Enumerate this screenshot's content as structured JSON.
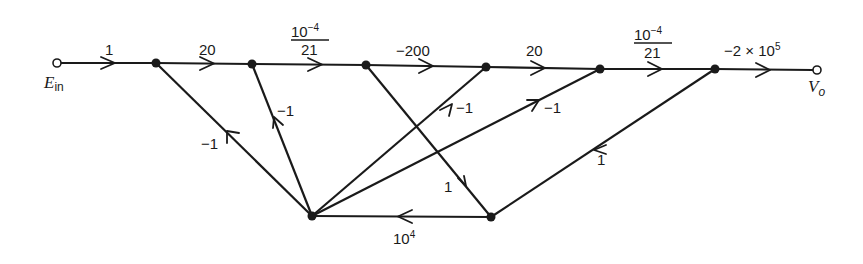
{
  "diagram": {
    "type": "signal-flow-graph",
    "input": {
      "label": "E",
      "subscript": "in"
    },
    "output": {
      "label": "V",
      "subscript": "o"
    },
    "nodes": [
      {
        "id": "Ein",
        "x": 57,
        "y": 63,
        "kind": "source"
      },
      {
        "id": "N1",
        "x": 156,
        "y": 63
      },
      {
        "id": "N2",
        "x": 252,
        "y": 64
      },
      {
        "id": "N3",
        "x": 366,
        "y": 65
      },
      {
        "id": "N4",
        "x": 486,
        "y": 67
      },
      {
        "id": "N5",
        "x": 600,
        "y": 69
      },
      {
        "id": "N6",
        "x": 715,
        "y": 69
      },
      {
        "id": "Vo",
        "x": 817,
        "y": 70,
        "kind": "sink"
      },
      {
        "id": "B1",
        "x": 312,
        "y": 216
      },
      {
        "id": "B2",
        "x": 491,
        "y": 217
      }
    ],
    "edges": [
      {
        "from": "Ein",
        "to": "N1",
        "gain": "1"
      },
      {
        "from": "N1",
        "to": "N2",
        "gain": "20"
      },
      {
        "from": "N2",
        "to": "N3",
        "gain_num": "10",
        "gain_exp": "−4",
        "gain_den": "21"
      },
      {
        "from": "N3",
        "to": "N4",
        "gain": "−200"
      },
      {
        "from": "N4",
        "to": "N5",
        "gain": "20"
      },
      {
        "from": "N5",
        "to": "N6",
        "gain_num": "10",
        "gain_exp": "−4",
        "gain_den": "21"
      },
      {
        "from": "N6",
        "to": "Vo",
        "gain_base": "−2 × 10",
        "gain_exp": "5"
      },
      {
        "from": "B1",
        "to": "N1",
        "gain": "−1"
      },
      {
        "from": "B1",
        "to": "N2",
        "gain": "−1"
      },
      {
        "from": "B1",
        "to": "N4",
        "gain": "−1"
      },
      {
        "from": "B1",
        "to": "N5",
        "gain": "−1"
      },
      {
        "from": "N3",
        "to": "B2",
        "gain": "1"
      },
      {
        "from": "B2",
        "to": "B1",
        "gain_base": "10",
        "gain_exp": "4"
      },
      {
        "from": "N6",
        "to": "B2",
        "gain": "1"
      }
    ]
  }
}
